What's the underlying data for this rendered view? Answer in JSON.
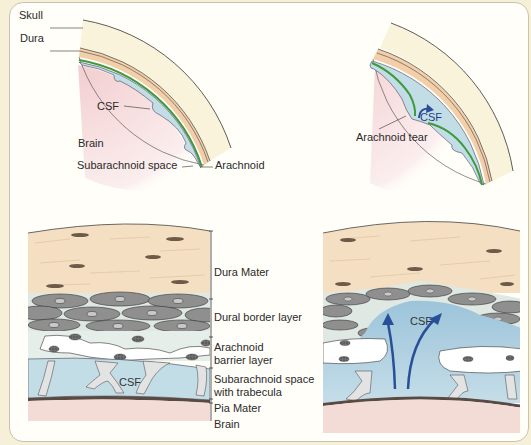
{
  "figure": {
    "top_left": {
      "title": "Normal meninges (overview)",
      "labels": {
        "skull": "Skull",
        "dura": "Dura",
        "csf": "CSF",
        "brain": "Brain",
        "subarachnoid_space": "Subarachnoid space",
        "arachnoid": "Arachnoid"
      }
    },
    "top_right": {
      "labels": {
        "csf": "CSF",
        "arachnoid_tear": "Arachnoid tear"
      }
    },
    "bottom_left": {
      "layers": [
        {
          "label": "Dura Mater"
        },
        {
          "label": "Dural border layer"
        },
        {
          "label": "Arachnoid barrier layer",
          "lines": [
            "Arachnoid",
            "barrier layer"
          ]
        },
        {
          "label": "Subarachnoid space with trabecula",
          "lines": [
            "Subarachnoid space",
            "with trabecula"
          ]
        },
        {
          "label": "Pia Mater"
        },
        {
          "label": "Brain"
        }
      ],
      "csf_label": "CSF"
    },
    "bottom_right": {
      "csf_label": "CSF"
    }
  },
  "colors": {
    "skull": "#faf3dc",
    "dura": "#f2cfa8",
    "arachnoid": "#3d9a3d",
    "csf": "#c3dde6",
    "brain": "#f6dcdc",
    "dural_border_cells": "#8f8f8f",
    "arrow": "#2a4f99"
  }
}
